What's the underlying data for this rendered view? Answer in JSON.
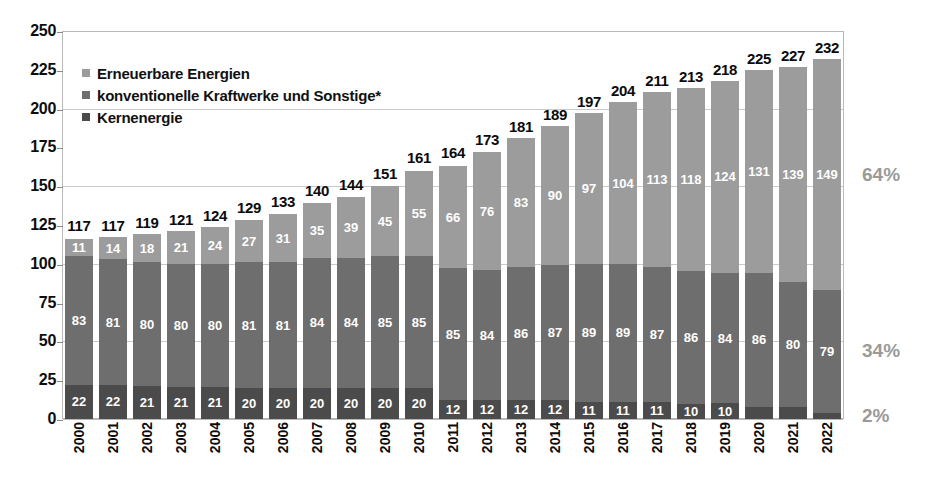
{
  "chart_data": {
    "type": "bar",
    "subtype": "stacked-bar",
    "title": "",
    "subtitle": "",
    "xlabel": "",
    "ylabel": "",
    "ylim": [
      0,
      250
    ],
    "yticks": [
      0,
      25,
      50,
      75,
      100,
      125,
      150,
      175,
      200,
      225,
      250
    ],
    "grid": true,
    "legend_position": "top-left",
    "categories": [
      "2000",
      "2001",
      "2002",
      "2003",
      "2004",
      "2005",
      "2006",
      "2007",
      "2008",
      "2009",
      "2010",
      "2011",
      "2012",
      "2013",
      "2014",
      "2015",
      "2016",
      "2017",
      "2018",
      "2019",
      "2020",
      "2021",
      "2022"
    ],
    "series": [
      {
        "name": "Erneuerbare Energien",
        "color": "#9c9c9c",
        "stack_order": "top",
        "values": [
          11,
          14,
          18,
          21,
          24,
          27,
          31,
          35,
          39,
          45,
          55,
          66,
          76,
          83,
          90,
          97,
          104,
          113,
          118,
          124,
          131,
          139,
          149
        ]
      },
      {
        "name": "konventionelle Kraftwerke und Sonstige*",
        "color": "#6e6e6e",
        "stack_order": "middle",
        "values": [
          83,
          81,
          80,
          80,
          80,
          81,
          81,
          84,
          84,
          85,
          85,
          85,
          84,
          86,
          87,
          89,
          89,
          87,
          86,
          84,
          86,
          80,
          79
        ]
      },
      {
        "name": "Kernenergie",
        "color": "#4b4b4b",
        "stack_order": "bottom",
        "values": [
          22,
          22,
          21,
          21,
          21,
          20,
          20,
          20,
          20,
          20,
          20,
          12,
          12,
          12,
          12,
          11,
          11,
          11,
          10,
          10,
          8,
          8,
          4
        ]
      }
    ],
    "totals": [
      117,
      117,
      119,
      121,
      124,
      129,
      133,
      140,
      144,
      151,
      161,
      164,
      173,
      181,
      189,
      197,
      204,
      211,
      213,
      218,
      225,
      227,
      232
    ],
    "annotations": [
      {
        "name": "share-renewables",
        "text": "64%",
        "value": 64,
        "series": "Erneuerbare Energien"
      },
      {
        "name": "share-conventional",
        "text": "34%",
        "value": 34,
        "series": "konventionelle Kraftwerke und Sonstige*"
      },
      {
        "name": "share-nuclear",
        "text": "2%",
        "value": 2,
        "series": "Kernenergie"
      }
    ]
  },
  "legend": {
    "items": [
      {
        "label": "Erneuerbare Energien",
        "color": "#9c9c9c"
      },
      {
        "label": "konventionelle Kraftwerke und Sonstige*",
        "color": "#6e6e6e"
      },
      {
        "label": "Kernenergie",
        "color": "#4b4b4b"
      }
    ]
  },
  "axis": {
    "y_tick_labels": [
      "250",
      "225",
      "200",
      "175",
      "150",
      "125",
      "100",
      "75",
      "50",
      "25",
      "0"
    ],
    "x_tick_labels": [
      "2000",
      "2001",
      "2002",
      "2003",
      "2004",
      "2005",
      "2006",
      "2007",
      "2008",
      "2009",
      "2010",
      "2011",
      "2012",
      "2013",
      "2014",
      "2015",
      "2016",
      "2017",
      "2018",
      "2019",
      "2020",
      "2021",
      "2022"
    ]
  },
  "side_labels": {
    "renewables_pct": "64%",
    "conventional_pct": "34%",
    "nuclear_pct": "2%"
  }
}
